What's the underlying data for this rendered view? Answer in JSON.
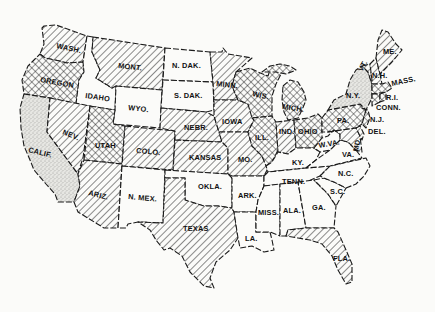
{
  "map": {
    "title": "",
    "region": "Contiguous United States",
    "legend": {
      "hatched": "diagonal hatching",
      "crosshatched": "crosshatching",
      "stippled": "stippled / dotted",
      "blank": "unshaded"
    },
    "colors": {
      "ink": "#1a1a1a",
      "paper": "#fbfbf9",
      "stipple": "#d9d9d6"
    },
    "states": {
      "wash": {
        "label": "WASH.",
        "pattern": "hatched"
      },
      "oregon": {
        "label": "OREGON",
        "pattern": "crosshatched"
      },
      "calif": {
        "label": "CALIF.",
        "pattern": "stippled"
      },
      "idaho": {
        "label": "IDAHO",
        "pattern": "blank"
      },
      "nev": {
        "label": "NEV.",
        "pattern": "hatched"
      },
      "mont": {
        "label": "MONT.",
        "pattern": "hatched"
      },
      "wyo": {
        "label": "WYO.",
        "pattern": "blank"
      },
      "utah": {
        "label": "UTAH",
        "pattern": "crosshatched"
      },
      "ariz": {
        "label": "ARIZ.",
        "pattern": "hatched"
      },
      "colo": {
        "label": "COLO.",
        "pattern": "hatched"
      },
      "nmex": {
        "label": "N. MEX.",
        "pattern": "blank"
      },
      "ndak": {
        "label": "N. DAK.",
        "pattern": "blank"
      },
      "sdak": {
        "label": "S. DAK.",
        "pattern": "blank"
      },
      "nebr": {
        "label": "NEBR.",
        "pattern": "hatched"
      },
      "kansas": {
        "label": "KANSAS",
        "pattern": "hatched"
      },
      "okla": {
        "label": "OKLA.",
        "pattern": "blank"
      },
      "texas": {
        "label": "TEXAS",
        "pattern": "hatched"
      },
      "minn": {
        "label": "MINN.",
        "pattern": "hatched"
      },
      "iowa": {
        "label": "IOWA",
        "pattern": "hatched"
      },
      "mo": {
        "label": "MO.",
        "pattern": "hatched"
      },
      "ark": {
        "label": "ARK.",
        "pattern": "blank"
      },
      "la": {
        "label": "LA.",
        "pattern": "blank"
      },
      "wis": {
        "label": "WIS.",
        "pattern": "crosshatched"
      },
      "mich": {
        "label": "MICH.",
        "pattern": "crosshatched"
      },
      "ill": {
        "label": "ILL.",
        "pattern": "crosshatched"
      },
      "ind": {
        "label": "IND.",
        "pattern": "hatched"
      },
      "ohio": {
        "label": "OHIO",
        "pattern": "crosshatched"
      },
      "ky": {
        "label": "KY.",
        "pattern": "blank"
      },
      "tenn": {
        "label": "TENN.",
        "pattern": "blank"
      },
      "miss": {
        "label": "MISS.",
        "pattern": "blank"
      },
      "ala": {
        "label": "ALA.",
        "pattern": "blank"
      },
      "ga": {
        "label": "GA.",
        "pattern": "blank"
      },
      "fla": {
        "label": "FLA.",
        "pattern": "hatched"
      },
      "sc": {
        "label": "S.C.",
        "pattern": "blank"
      },
      "nc": {
        "label": "N.C.",
        "pattern": "blank"
      },
      "va": {
        "label": "VA.",
        "pattern": "blank"
      },
      "wva": {
        "label": "W.VA.",
        "pattern": "blank"
      },
      "md": {
        "label": "MD.",
        "pattern": "hatched"
      },
      "del": {
        "label": "DEL.",
        "pattern": "hatched"
      },
      "pa": {
        "label": "PA.",
        "pattern": "crosshatched"
      },
      "nj": {
        "label": "N.J.",
        "pattern": "crosshatched"
      },
      "ny": {
        "label": "N.Y.",
        "pattern": "stippled"
      },
      "vt": {
        "label": "VT.",
        "pattern": "hatched"
      },
      "nh": {
        "label": "N.H.",
        "pattern": "hatched"
      },
      "me": {
        "label": "ME.",
        "pattern": "hatched"
      },
      "mass": {
        "label": "MASS.",
        "pattern": "crosshatched"
      },
      "ri": {
        "label": "R.I.",
        "pattern": "crosshatched"
      },
      "conn": {
        "label": "CONN.",
        "pattern": "crosshatched"
      }
    }
  }
}
